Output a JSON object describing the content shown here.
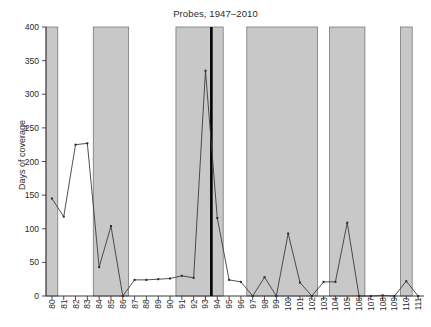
{
  "chart_data": {
    "type": "line",
    "title": "Probes, 1947–2010",
    "xlabel": "",
    "ylabel": "Days of coverage",
    "ylim": [
      0,
      400
    ],
    "yticks": [
      0,
      50,
      100,
      150,
      200,
      250,
      300,
      350,
      400
    ],
    "ytick_labels": [
      "0",
      "50",
      "100",
      "150",
      "200",
      "250",
      "300",
      "350",
      "400"
    ],
    "grid": false,
    "legend": "none",
    "categories": [
      "80",
      "81",
      "82",
      "83",
      "84",
      "85",
      "86",
      "87",
      "88",
      "89",
      "90",
      "91",
      "92",
      "93",
      "94",
      "95",
      "96",
      "97",
      "98",
      "99",
      "100",
      "101",
      "102",
      "103",
      "104",
      "105",
      "106",
      "107",
      "108",
      "109",
      "110",
      "111"
    ],
    "xtick_labels": [
      "80",
      "81",
      "82",
      "83",
      "84",
      "85",
      "86",
      "87",
      "88",
      "89",
      "90",
      "91",
      "92",
      "93",
      "94",
      "95",
      "96",
      "97",
      "98",
      "99",
      "100",
      "101",
      "102",
      "103",
      "104",
      "105",
      "106",
      "107",
      "108",
      "109",
      "110",
      "111"
    ],
    "values": [
      145,
      118,
      225,
      227,
      43,
      104,
      0,
      24,
      24,
      25,
      26,
      30,
      27,
      335,
      116,
      24,
      21,
      0,
      28,
      0,
      93,
      20,
      0,
      21,
      21,
      109,
      0,
      0,
      1,
      0,
      22,
      0
    ],
    "series": [
      {
        "name": "Days of coverage",
        "values": [
          145,
          118,
          225,
          227,
          43,
          104,
          0,
          24,
          24,
          25,
          26,
          30,
          27,
          335,
          116,
          24,
          21,
          0,
          28,
          0,
          93,
          20,
          0,
          21,
          21,
          109,
          0,
          0,
          1,
          0,
          22,
          0
        ]
      }
    ],
    "shaded_bands": [
      {
        "from": "80",
        "to": "80",
        "meaning": "highlighted-congress"
      },
      {
        "from": "84",
        "to": "86",
        "meaning": "highlighted-congress"
      },
      {
        "from": "91",
        "to": "94",
        "meaning": "highlighted-congress"
      },
      {
        "from": "97",
        "to": "102",
        "meaning": "highlighted-congress"
      },
      {
        "from": "104",
        "to": "106",
        "meaning": "highlighted-congress"
      },
      {
        "from": "110",
        "to": "110",
        "meaning": "highlighted-congress"
      }
    ],
    "event_markers": [
      {
        "at": "94",
        "style": "thick-black-vertical-line"
      }
    ],
    "annotations": []
  }
}
